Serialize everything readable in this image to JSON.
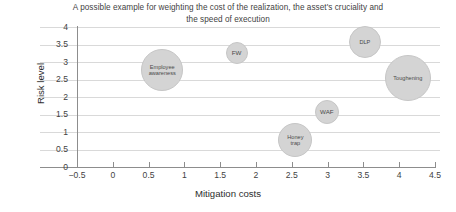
{
  "chart_data": {
    "type": "scatter",
    "title": "A possible example for weighting the cost of the realization, the asset's cruciality and the speed of execution",
    "title_line1": "A possible example for weighting the cost of the realization, the asset's cruciality and",
    "title_line2": "the speed of execution",
    "xlabel": "Mitigation costs",
    "ylabel": "Risk level",
    "xlim": [
      -0.5,
      4.5
    ],
    "ylim": [
      0,
      4
    ],
    "xticks": [
      "-0.5",
      "0",
      "0.5",
      "1",
      "1.5",
      "2",
      "2.5",
      "3",
      "3.5",
      "4",
      "4.5"
    ],
    "xtick_values": [
      -0.5,
      0,
      0.5,
      1,
      1.5,
      2,
      2.5,
      3,
      3.5,
      4,
      4.5
    ],
    "yticks": [
      "0",
      "0.5",
      "1",
      "1.5",
      "2",
      "2.5",
      "3",
      "3.5",
      "4"
    ],
    "ytick_values": [
      0,
      0.5,
      1,
      1.5,
      2,
      2.5,
      3,
      3.5,
      4
    ],
    "grid": true,
    "grid_axis": "y",
    "legend": false,
    "bubble_color": "#d4d4d4",
    "points": [
      {
        "label": "Employee\nawareness",
        "x": 0.69,
        "y": 2.77,
        "r": 21
      },
      {
        "label": "FW",
        "x": 1.73,
        "y": 3.26,
        "r": 11
      },
      {
        "label": "DLP",
        "x": 3.52,
        "y": 3.57,
        "r": 16
      },
      {
        "label": "Toughening",
        "x": 4.12,
        "y": 2.54,
        "r": 23
      },
      {
        "label": "WAF",
        "x": 2.99,
        "y": 1.57,
        "r": 12
      },
      {
        "label": "Honey\ntrap",
        "x": 2.55,
        "y": 0.77,
        "r": 17
      }
    ]
  }
}
